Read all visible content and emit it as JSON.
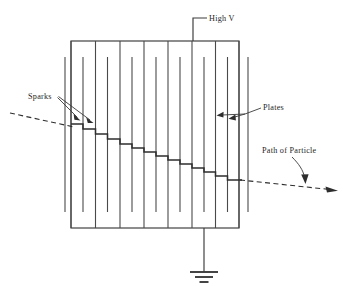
{
  "diagram": {
    "type": "physics-apparatus-schematic",
    "background_color": "#ffffff",
    "line_color": "#3a3a3a",
    "labels": {
      "high_voltage": "High V",
      "sparks": "Sparks",
      "plates": "Plates",
      "path_of_particle": "Path of Particle"
    },
    "components": {
      "chamber": {
        "name": "chamber-outline",
        "x": 71,
        "y": 41,
        "width": 168,
        "height": 187
      },
      "top_rail_plates_x": [
        71,
        95.5,
        120,
        144,
        168,
        192,
        215.5,
        239
      ],
      "bottom_rail_plates_x": [
        83,
        107.5,
        132,
        156,
        180,
        204,
        227.5
      ],
      "outer_plates_x": [
        65,
        248
      ],
      "plate_count_total": 17,
      "high_voltage_lead": {
        "vertical_x": 193,
        "top_y": 18,
        "bottom_y": 41,
        "elbow_x": 207
      },
      "ground_lead": {
        "vertical_x": 204,
        "top_y": 228,
        "bottom_y": 272
      },
      "ground_symbol": {
        "bars": [
          {
            "half_width": 14,
            "y": 272
          },
          {
            "half_width": 9,
            "y": 277
          },
          {
            "half_width": 4.5,
            "y": 282
          }
        ]
      },
      "spark_staircase_steps": [
        {
          "x1": 71,
          "x2": 83,
          "y": 124
        },
        {
          "x1": 83,
          "x2": 95.5,
          "y": 129
        },
        {
          "x1": 95.5,
          "x2": 107.5,
          "y": 134
        },
        {
          "x1": 107.5,
          "x2": 120,
          "y": 139
        },
        {
          "x1": 120,
          "x2": 132,
          "y": 144
        },
        {
          "x1": 132,
          "x2": 144,
          "y": 148
        },
        {
          "x1": 144,
          "x2": 156,
          "y": 152
        },
        {
          "x1": 156,
          "x2": 168,
          "y": 156
        },
        {
          "x1": 168,
          "x2": 180,
          "y": 160
        },
        {
          "x1": 180,
          "x2": 192,
          "y": 164
        },
        {
          "x1": 192,
          "x2": 204,
          "y": 168
        },
        {
          "x1": 204,
          "x2": 215.5,
          "y": 172
        },
        {
          "x1": 215.5,
          "x2": 227.5,
          "y": 176
        },
        {
          "x1": 227.5,
          "x2": 242,
          "y": 180
        }
      ],
      "particle_entry_dashed": {
        "x1": 10,
        "y1": 113,
        "x2": 73,
        "y2": 127
      },
      "particle_exit_dashed": {
        "x1": 240,
        "y1": 180,
        "x2": 338,
        "y2": 190
      }
    }
  }
}
